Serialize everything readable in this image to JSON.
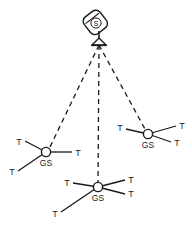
{
  "figure": {
    "background_color": "#ffffff",
    "stroke_color": "#1a1a1a",
    "node_fill_color": "#ffffff",
    "width": 192,
    "height": 226
  },
  "satellite": {
    "label": "S",
    "name": "satellite",
    "x": 96,
    "y": 22,
    "antenna_apex_x": 99,
    "antenna_apex_y": 44,
    "body_rotation_deg": -38
  },
  "beams": {
    "style": "dashed",
    "dash_pattern": "5 4",
    "stroke_width": 1.3,
    "links": [
      {
        "name": "beam-to-gs-left",
        "from": "satellite",
        "to": "gs-left"
      },
      {
        "name": "beam-to-gs-bottom",
        "from": "satellite",
        "to": "gs-bottom"
      },
      {
        "name": "beam-to-gs-right",
        "from": "satellite",
        "to": "gs-right"
      }
    ]
  },
  "ground_stations": [
    {
      "id": "gs-left",
      "label": "GS",
      "x": 46,
      "y": 152,
      "radius": 4.6,
      "label_dx": 0,
      "label_dy": 14,
      "terminals": [
        {
          "label": "T",
          "lx": 19,
          "ly": 145,
          "ex": 25,
          "ey": 141
        },
        {
          "label": "T",
          "lx": 12,
          "ly": 175,
          "ex": 18,
          "ey": 171
        },
        {
          "label": "T",
          "lx": 78,
          "ly": 156,
          "ex": 72,
          "ey": 152
        }
      ]
    },
    {
      "id": "gs-right",
      "label": "GS",
      "x": 148,
      "y": 134,
      "radius": 4.6,
      "label_dx": 0,
      "label_dy": 14,
      "terminals": [
        {
          "label": "T",
          "lx": 120,
          "ly": 131,
          "ex": 126,
          "ey": 128
        },
        {
          "label": "T",
          "lx": 181,
          "ly": 129,
          "ex": 175,
          "ey": 126
        },
        {
          "label": "T",
          "lx": 176,
          "ly": 145,
          "ex": 170,
          "ey": 142
        }
      ]
    },
    {
      "id": "gs-bottom",
      "label": "GS",
      "x": 98,
      "y": 187,
      "radius": 4.6,
      "label_dx": 0,
      "label_dy": 14,
      "terminals": [
        {
          "label": "T",
          "lx": 67,
          "ly": 186,
          "ex": 73,
          "ey": 183
        },
        {
          "label": "T",
          "lx": 55,
          "ly": 216,
          "ex": 61,
          "ey": 212
        },
        {
          "label": "T",
          "lx": 130,
          "ly": 183,
          "ex": 124,
          "ey": 180
        },
        {
          "label": "T",
          "lx": 130,
          "ly": 197,
          "ex": 124,
          "ey": 194
        }
      ]
    }
  ],
  "legend_keys": {
    "satellite_key": "S",
    "ground_station_key": "GS",
    "terminal_key": "T"
  }
}
